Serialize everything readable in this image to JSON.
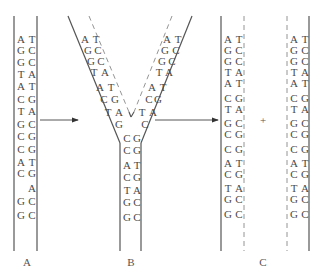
{
  "colors": {
    "strand": "#555555",
    "new_strand": "#888888",
    "text": "#4a4a4a"
  },
  "panels": {
    "A": {
      "label": "A",
      "label_pos": [
        27,
        266
      ],
      "lines": [
        {
          "type": "solid",
          "x1": 14,
          "y1": 16,
          "x2": 14,
          "y2": 251
        },
        {
          "type": "solid",
          "x1": 37,
          "y1": 16,
          "x2": 37,
          "y2": 251
        }
      ],
      "left_x": 18,
      "right_x": 29,
      "rows": [
        {
          "y": 43,
          "l": "A",
          "r": "T"
        },
        {
          "y": 54,
          "l": "G",
          "r": "C"
        },
        {
          "y": 66,
          "l": "G",
          "r": "C"
        },
        {
          "y": 78,
          "l": "T",
          "r": "A"
        },
        {
          "y": 90,
          "l": "A",
          "r": "T"
        },
        {
          "y": 103,
          "l": "C",
          "r": "G"
        },
        {
          "y": 115,
          "l": "T",
          "r": "A"
        },
        {
          "y": 128,
          "l": "G",
          "r": "C"
        },
        {
          "y": 140,
          "l": "C",
          "r": "G"
        },
        {
          "y": 153,
          "l": "C",
          "r": "G"
        },
        {
          "y": 166,
          "l": "A",
          "r": "T"
        },
        {
          "y": 177,
          "l": "C",
          "r": "G"
        },
        {
          "y": 192,
          "l": "",
          "r": "A"
        },
        {
          "y": 205,
          "l": "G",
          "r": "C"
        },
        {
          "y": 219,
          "l": "G",
          "r": "C"
        }
      ]
    },
    "B": {
      "label": "B",
      "label_pos": [
        131,
        266
      ],
      "lines": [
        {
          "type": "solid",
          "x1": 68,
          "y1": 16,
          "x2": 120,
          "y2": 143
        },
        {
          "type": "solid",
          "x1": 120,
          "y1": 143,
          "x2": 120,
          "y2": 251
        },
        {
          "type": "solid",
          "x1": 192,
          "y1": 16,
          "x2": 141,
          "y2": 143
        },
        {
          "type": "solid",
          "x1": 141,
          "y1": 143,
          "x2": 141,
          "y2": 251
        },
        {
          "type": "dashed",
          "x1": 89,
          "y1": 16,
          "x2": 129,
          "y2": 112
        },
        {
          "type": "dashed",
          "x1": 172,
          "y1": 16,
          "x2": 134,
          "y2": 112
        },
        {
          "type": "solid",
          "x1": 129,
          "y1": 112,
          "x2": 131,
          "y2": 117
        },
        {
          "type": "solid",
          "x1": 134,
          "y1": 112,
          "x2": 131,
          "y2": 117
        }
      ],
      "left_arm": [
        {
          "x": 82,
          "y": 43,
          "t": "A"
        },
        {
          "x": 93,
          "y": 43,
          "t": "T"
        },
        {
          "x": 85,
          "y": 54,
          "t": "G"
        },
        {
          "x": 95,
          "y": 54,
          "t": "C"
        },
        {
          "x": 88,
          "y": 65,
          "t": "G"
        },
        {
          "x": 98,
          "y": 65,
          "t": "C"
        },
        {
          "x": 91,
          "y": 76,
          "t": "T"
        },
        {
          "x": 102,
          "y": 76,
          "t": "A"
        },
        {
          "x": 97,
          "y": 91,
          "t": "A"
        },
        {
          "x": 108,
          "y": 91,
          "t": "T"
        },
        {
          "x": 101,
          "y": 103,
          "t": "C"
        },
        {
          "x": 112,
          "y": 103,
          "t": "G"
        },
        {
          "x": 105,
          "y": 116,
          "t": "T"
        },
        {
          "x": 116,
          "y": 116,
          "t": "A"
        },
        {
          "x": 116,
          "y": 128,
          "t": "G"
        }
      ],
      "right_arm": [
        {
          "x": 164,
          "y": 43,
          "t": "A"
        },
        {
          "x": 175,
          "y": 43,
          "t": "T"
        },
        {
          "x": 162,
          "y": 54,
          "t": "G"
        },
        {
          "x": 173,
          "y": 54,
          "t": "C"
        },
        {
          "x": 159,
          "y": 65,
          "t": "G"
        },
        {
          "x": 169,
          "y": 65,
          "t": "C"
        },
        {
          "x": 156,
          "y": 76,
          "t": "T"
        },
        {
          "x": 166,
          "y": 76,
          "t": "A"
        },
        {
          "x": 149,
          "y": 91,
          "t": "A"
        },
        {
          "x": 160,
          "y": 91,
          "t": "T"
        },
        {
          "x": 146,
          "y": 103,
          "t": "C"
        },
        {
          "x": 155,
          "y": 103,
          "t": "G"
        },
        {
          "x": 139,
          "y": 116,
          "t": "T"
        },
        {
          "x": 150,
          "y": 116,
          "t": "A"
        },
        {
          "x": 142,
          "y": 128,
          "t": "C"
        }
      ],
      "stem_left_x": 124,
      "stem_right_x": 134,
      "stem": [
        {
          "y": 142,
          "l": "C",
          "r": "G"
        },
        {
          "y": 154,
          "l": "C",
          "r": "G"
        },
        {
          "y": 169,
          "l": "A",
          "r": "T"
        },
        {
          "y": 181,
          "l": "C",
          "r": "G"
        },
        {
          "y": 194,
          "l": "T",
          "r": "A"
        },
        {
          "y": 206,
          "l": "G",
          "r": "C"
        },
        {
          "y": 221,
          "l": "G",
          "r": "C"
        }
      ]
    },
    "C": {
      "label": "C",
      "label_pos": [
        263,
        266
      ],
      "plus": "+",
      "plus_pos": [
        263,
        124
      ],
      "duplexes": [
        {
          "lines": [
            {
              "type": "solid",
              "x1": 221,
              "y1": 16,
              "x2": 221,
              "y2": 251
            },
            {
              "type": "dashed",
              "x1": 244,
              "y1": 16,
              "x2": 244,
              "y2": 251
            }
          ],
          "left_x": 225,
          "right_x": 236
        },
        {
          "lines": [
            {
              "type": "dashed",
              "x1": 287,
              "y1": 16,
              "x2": 287,
              "y2": 251
            },
            {
              "type": "solid",
              "x1": 309,
              "y1": 16,
              "x2": 309,
              "y2": 251
            }
          ],
          "left_x": 291,
          "right_x": 302
        }
      ],
      "rows": [
        {
          "y": 43,
          "l": "A",
          "r": "T"
        },
        {
          "y": 54,
          "l": "G",
          "r": "C"
        },
        {
          "y": 65,
          "l": "G",
          "r": "C"
        },
        {
          "y": 76,
          "l": "T",
          "r": "A"
        },
        {
          "y": 87,
          "l": "A",
          "r": "T"
        },
        {
          "y": 102,
          "l": "C",
          "r": "G"
        },
        {
          "y": 113,
          "l": "T",
          "r": "A"
        },
        {
          "y": 127,
          "l": "G",
          "r": "C"
        },
        {
          "y": 138,
          "l": "C",
          "r": "G"
        },
        {
          "y": 153,
          "l": "C",
          "r": "G"
        },
        {
          "y": 167,
          "l": "A",
          "r": "T"
        },
        {
          "y": 178,
          "l": "C",
          "r": "G"
        },
        {
          "y": 192,
          "l": "T",
          "r": "A"
        },
        {
          "y": 203,
          "l": "G",
          "r": "C"
        },
        {
          "y": 218,
          "l": "G",
          "r": "C"
        }
      ]
    }
  },
  "arrows": [
    {
      "x1": 40,
      "y1": 120,
      "x2": 78,
      "y2": 120
    },
    {
      "x1": 155,
      "y1": 120,
      "x2": 218,
      "y2": 120
    }
  ]
}
